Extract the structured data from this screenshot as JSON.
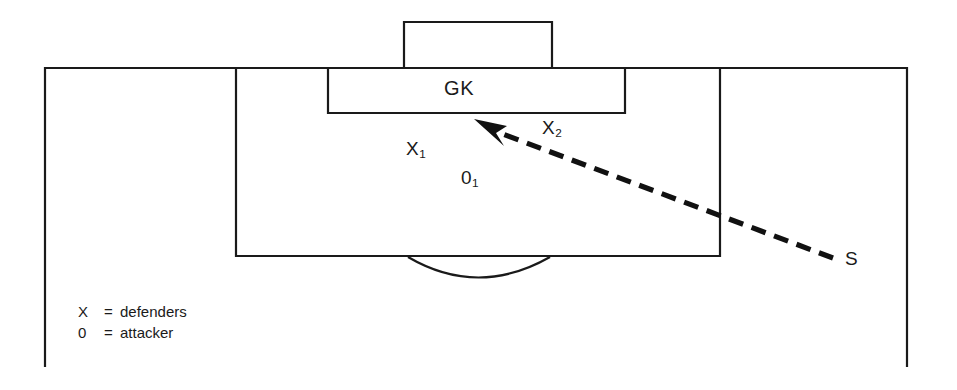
{
  "diagram": {
    "goalkeeper_label": "GK",
    "players": [
      {
        "id": "x1",
        "label": "X",
        "subscript": "1",
        "role": "defender"
      },
      {
        "id": "x2",
        "label": "X",
        "subscript": "2",
        "role": "defender"
      },
      {
        "id": "o1",
        "label": "0",
        "subscript": "1",
        "role": "attacker"
      }
    ],
    "shot_origin_label": "S",
    "legend": {
      "rows": [
        {
          "symbol": "X",
          "equals": "=",
          "text": "defenders"
        },
        {
          "symbol": "0",
          "equals": "=",
          "text": "attacker"
        }
      ]
    },
    "colors": {
      "line": "#1a1a1a",
      "shot": "#111111",
      "background": "#ffffff"
    }
  }
}
